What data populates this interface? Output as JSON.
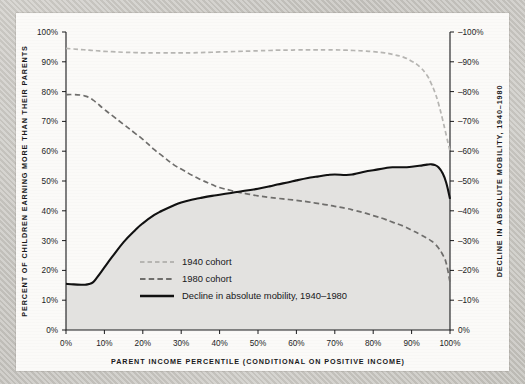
{
  "chart_data": {
    "type": "line",
    "title": "",
    "subtitle": "",
    "xlabel": "PARENT INCOME PERCENTILE (CONDITIONAL ON POSITIVE INCOME)",
    "ylabel": "PERCENT OF CHILDREN EARNING MORE THAN THEIR PARENTS",
    "y2label": "DECLINE IN ABSOLUTE MOBILITY, 1940–1980",
    "xlim": [
      0,
      100
    ],
    "ylim": [
      0,
      100
    ],
    "y2lim": [
      -100,
      0
    ],
    "grid": false,
    "legend_position": "center-left-inside",
    "xticks": [
      "0%",
      "10%",
      "20%",
      "30%",
      "40%",
      "50%",
      "60%",
      "70%",
      "80%",
      "90%",
      "100%"
    ],
    "xtick_values": [
      0,
      10,
      20,
      30,
      40,
      50,
      60,
      70,
      80,
      90,
      100
    ],
    "yticks": [
      "0%",
      "10%",
      "20%",
      "30%",
      "40%",
      "50%",
      "60%",
      "70%",
      "80%",
      "90%",
      "100%"
    ],
    "ytick_values": [
      0,
      10,
      20,
      30,
      40,
      50,
      60,
      70,
      80,
      90,
      100
    ],
    "y2ticks": [
      "0%",
      "–10%",
      "–20%",
      "–30%",
      "–40%",
      "–50%",
      "–60%",
      "–70%",
      "–80%",
      "–90%",
      "–100%"
    ],
    "y2tick_values": [
      0,
      -10,
      -20,
      -30,
      -40,
      -50,
      -60,
      -70,
      -80,
      -90,
      -100
    ],
    "x": [
      0,
      2,
      4,
      5,
      6,
      7,
      8,
      10,
      12,
      15,
      18,
      20,
      23,
      25,
      28,
      30,
      33,
      35,
      38,
      40,
      43,
      45,
      48,
      50,
      53,
      55,
      58,
      60,
      63,
      65,
      68,
      70,
      73,
      75,
      78,
      80,
      83,
      85,
      88,
      90,
      92,
      94,
      95,
      96,
      97,
      98,
      99,
      100
    ],
    "series": [
      {
        "name": "1940 cohort",
        "style": "dashed",
        "color": "#b6b5b2",
        "values": [
          94.5,
          94.3,
          94.1,
          94.0,
          93.9,
          93.8,
          93.7,
          93.5,
          93.4,
          93.2,
          93.1,
          93.0,
          93.0,
          93.0,
          93.0,
          93.0,
          93.0,
          93.1,
          93.2,
          93.3,
          93.4,
          93.5,
          93.6,
          93.7,
          93.8,
          93.9,
          93.9,
          94.0,
          94.0,
          94.0,
          94.0,
          94.0,
          93.9,
          93.8,
          93.6,
          93.4,
          93.0,
          92.5,
          91.5,
          90.2,
          88.5,
          85.5,
          83.0,
          80.0,
          76.0,
          71.0,
          65.5,
          60.0
        ]
      },
      {
        "name": "1980 cohort",
        "style": "dashed",
        "color": "#6f6e6c",
        "values": [
          79.0,
          79.0,
          78.8,
          78.5,
          78.0,
          77.2,
          76.2,
          74.0,
          72.0,
          69.0,
          66.0,
          64.0,
          60.5,
          58.5,
          55.5,
          54.0,
          51.8,
          50.5,
          48.8,
          47.8,
          46.8,
          46.2,
          45.5,
          45.0,
          44.5,
          44.2,
          43.8,
          43.5,
          43.0,
          42.6,
          42.0,
          41.5,
          40.8,
          40.2,
          39.2,
          38.4,
          37.2,
          36.2,
          34.8,
          33.5,
          32.2,
          30.8,
          30.0,
          29.0,
          27.5,
          25.5,
          22.5,
          16.0
        ]
      },
      {
        "name": "Decline in absolute mobility, 1940–1980",
        "style": "solid",
        "color": "#111111",
        "values": [
          15.5,
          15.3,
          15.2,
          15.2,
          15.4,
          16.0,
          17.5,
          21.0,
          24.5,
          29.5,
          33.5,
          35.8,
          38.6,
          40.0,
          41.8,
          42.8,
          43.8,
          44.3,
          45.0,
          45.4,
          46.0,
          46.4,
          47.0,
          47.4,
          48.2,
          48.8,
          49.6,
          50.2,
          51.0,
          51.4,
          52.0,
          52.2,
          52.0,
          52.3,
          53.2,
          53.6,
          54.3,
          54.6,
          54.6,
          54.8,
          55.1,
          55.5,
          55.6,
          55.4,
          54.6,
          52.8,
          49.5,
          44.0
        ]
      }
    ],
    "shaded_area": {
      "between": "Decline in absolute mobility, 1940–1980",
      "baseline": 0,
      "color": "#e3e2e0"
    }
  },
  "legend": {
    "items": [
      {
        "label": "1940 cohort",
        "swatch": "dashed-light"
      },
      {
        "label": "1980 cohort",
        "swatch": "dashed-dark"
      },
      {
        "label": "Decline in absolute mobility, 1940–1980",
        "swatch": "solid-black"
      }
    ]
  }
}
